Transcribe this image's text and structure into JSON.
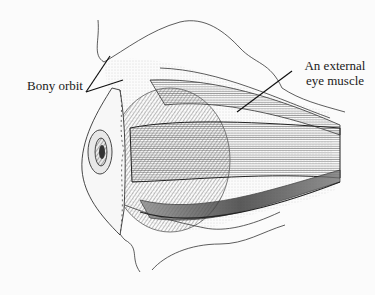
{
  "figure": {
    "labels": [
      {
        "id": "bony-orbit",
        "text": "Bony orbit"
      },
      {
        "id": "external-eye-muscle",
        "line1": "An external",
        "line2": "eye muscle"
      }
    ],
    "colors": {
      "background": "#fbfbfb",
      "ink": "#1a1a1a",
      "shade": "#9a9a9a"
    }
  }
}
